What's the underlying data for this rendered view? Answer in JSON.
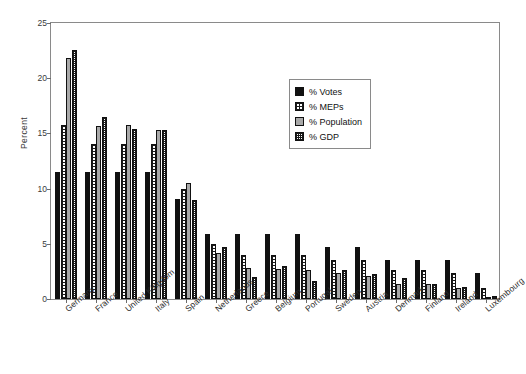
{
  "chart_data": {
    "type": "bar",
    "title": "",
    "xlabel": "",
    "ylabel": "Percent",
    "ylim": [
      0,
      25
    ],
    "yticks": [
      0,
      5,
      10,
      15,
      20,
      25
    ],
    "grid": false,
    "legend_position": "top-right",
    "categories": [
      "Germany",
      "France",
      "United Kingdom",
      "Italy",
      "Spain",
      "Netherlands",
      "Greece",
      "Belgium",
      "Portugal",
      "Sweden",
      "Austria",
      "Denmark",
      "Finland",
      "Ireland",
      "Luxembourg"
    ],
    "series": [
      {
        "name": "% Votes",
        "color": "#111111",
        "pattern": "solid-black",
        "values": [
          11.5,
          11.5,
          11.5,
          11.5,
          9.1,
          5.9,
          5.9,
          5.9,
          5.9,
          4.7,
          4.7,
          3.5,
          3.5,
          3.5,
          2.4
        ]
      },
      {
        "name": "% MEPs",
        "color": "#ffffff",
        "pattern": "coarse-checker",
        "values": [
          15.8,
          14.0,
          14.0,
          14.0,
          10.0,
          5.0,
          4.0,
          4.0,
          4.0,
          3.5,
          3.5,
          2.6,
          2.6,
          2.4,
          1.0
        ]
      },
      {
        "name": "% Population",
        "color": "#a9a9a9",
        "pattern": "solid-gray",
        "values": [
          21.8,
          15.7,
          15.8,
          15.3,
          10.5,
          4.2,
          2.8,
          2.7,
          2.6,
          2.4,
          2.1,
          1.4,
          1.4,
          1.0,
          0.1
        ]
      },
      {
        "name": "% GDP",
        "color": "#ffffff",
        "pattern": "fine-checker",
        "values": [
          22.6,
          16.5,
          15.4,
          15.3,
          9.0,
          4.7,
          2.0,
          3.0,
          1.6,
          2.6,
          2.3,
          1.9,
          1.4,
          1.1,
          0.3
        ]
      }
    ]
  },
  "legend": {
    "items": [
      {
        "label": "% Votes",
        "swatch": "solid-black"
      },
      {
        "label": "% MEPs",
        "swatch": "coarse-checker"
      },
      {
        "label": "% Population",
        "swatch": "solid-gray"
      },
      {
        "label": "% GDP",
        "swatch": "fine-checker"
      }
    ]
  }
}
